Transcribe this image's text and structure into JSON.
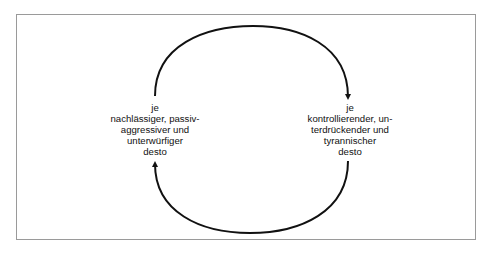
{
  "diagram": {
    "type": "cycle",
    "colors": {
      "frame_border": "#9a9a9a",
      "arrow": "#111111",
      "text": "#111111",
      "background": "#ffffff"
    },
    "nodes": [
      {
        "id": "left",
        "lines": [
          "je",
          "nachlässiger, passiv-",
          "aggressiver und",
          "unterwürfiger",
          "desto"
        ]
      },
      {
        "id": "right",
        "lines": [
          "je",
          "kontrollierender, un-",
          "terdrückender und",
          "tyrannischer",
          "desto"
        ]
      }
    ],
    "edges": [
      {
        "from": "left",
        "to": "right",
        "path": "upper-arc",
        "arrow": "down-at-right"
      },
      {
        "from": "right",
        "to": "left",
        "path": "lower-arc",
        "arrow": "up-at-left"
      }
    ]
  }
}
